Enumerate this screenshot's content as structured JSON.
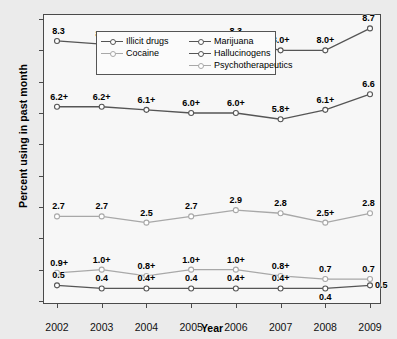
{
  "chart_data": {
    "type": "line",
    "title": "",
    "xlabel": "Year",
    "ylabel": "Percent using in past month",
    "categories": [
      "2002",
      "2003",
      "2004",
      "2005",
      "2006",
      "2007",
      "2008",
      "2009"
    ],
    "x": [
      2002,
      2003,
      2004,
      2005,
      2006,
      2007,
      2008,
      2009
    ],
    "ylim": [
      0,
      9
    ],
    "yticks": [
      "0",
      "1",
      "2",
      "3",
      "4",
      "5",
      "6",
      "7",
      "8",
      "9"
    ],
    "grid": false,
    "legend_position": "top-left inside",
    "annotation_note": "+ denotes a statistically significant difference",
    "series": [
      {
        "name": "Illicit drugs",
        "color": "#555555",
        "values": [
          8.3,
          8.2,
          7.9,
          8.1,
          8.3,
          8.0,
          8.0,
          8.7
        ],
        "labels": [
          "8.3",
          "8.2",
          "7.9+",
          "8.1+",
          "8.3",
          "8.0+",
          "8.0+",
          "8.7"
        ]
      },
      {
        "name": "Marijuana",
        "color": "#555555",
        "values": [
          6.2,
          6.2,
          6.1,
          6.0,
          6.0,
          5.8,
          6.1,
          6.6
        ],
        "labels": [
          "6.2+",
          "6.2+",
          "6.1+",
          "6.0+",
          "6.0+",
          "5.8+",
          "6.1+",
          "6.6"
        ]
      },
      {
        "name": "Psychotherapeutics",
        "color": "#a8a8a8",
        "values": [
          2.7,
          2.7,
          2.5,
          2.7,
          2.9,
          2.8,
          2.5,
          2.8
        ],
        "labels": [
          "2.7",
          "2.7",
          "2.5",
          "2.7",
          "2.9",
          "2.8",
          "2.5+",
          "2.8"
        ]
      },
      {
        "name": "Cocaine",
        "color": "#a8a8a8",
        "values": [
          0.9,
          1.0,
          0.8,
          1.0,
          1.0,
          0.8,
          0.7,
          0.7
        ],
        "labels": [
          "0.9+",
          "1.0+",
          "0.8+",
          "1.0+",
          "1.0+",
          "0.8+",
          "0.7",
          "0.7"
        ]
      },
      {
        "name": "Hallucinogens",
        "color": "#555555",
        "values": [
          0.5,
          0.4,
          0.4,
          0.4,
          0.4,
          0.4,
          0.4,
          0.5
        ],
        "labels": [
          "0.5",
          "0.4",
          "0.4+",
          "0.4",
          "0.4+",
          "0.4+",
          "0.4",
          "0.5"
        ]
      }
    ]
  },
  "legend": {
    "entries": [
      {
        "label": "Illicit drugs",
        "color": "#555555",
        "column": 0
      },
      {
        "label": "Marijuana",
        "color": "#555555",
        "column": 1
      },
      {
        "label": "Cocaine",
        "color": "#a8a8a8",
        "column": 0
      },
      {
        "label": "Hallucinogens",
        "color": "#555555",
        "column": 1
      },
      {
        "label": "Psychotherapeutics",
        "color": "#a8a8a8",
        "column": 1
      }
    ]
  }
}
